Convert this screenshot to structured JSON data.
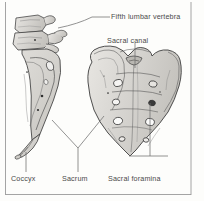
{
  "figure": {
    "kind": "anatomical-illustration",
    "views": [
      {
        "name": "lateral-view",
        "description": "Left lateral view of lower lumbar vertebrae, sacrum and coccyx"
      },
      {
        "name": "anterior-view",
        "description": "Anterior (ventral) view of the sacrum"
      }
    ],
    "frame_color": "#8c8c8c",
    "background_color": "#fdfdfb",
    "bone_fill": "#d8d6d2",
    "bone_outline": "#3c3c3c",
    "label_color": "#4a4a4a",
    "leader_color": "#6b6b6b"
  },
  "labels": {
    "fifth_lumbar_vertebra": "Fifth lumbar vertebra",
    "sacral_canal": "Sacral canal",
    "coccyx": "Coccyx",
    "sacrum": "Sacrum",
    "sacral_foramina": "Sacral foramina"
  },
  "structures": [
    {
      "id": "fifth-lumbar-vertebra",
      "label": "Fifth lumbar vertebra",
      "view": "lateral-view"
    },
    {
      "id": "sacral-canal",
      "label": "Sacral canal",
      "view": "anterior-view"
    },
    {
      "id": "coccyx",
      "label": "Coccyx",
      "view": "lateral-view"
    },
    {
      "id": "sacrum",
      "label": "Sacrum",
      "view": "both"
    },
    {
      "id": "sacral-foramina",
      "label": "Sacral foramina",
      "view": "anterior-view",
      "count": "4 pairs"
    }
  ]
}
